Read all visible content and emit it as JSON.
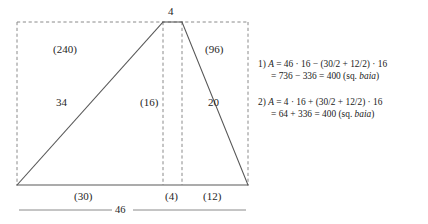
{
  "figure": {
    "colors": {
      "solid_line": "#585858",
      "dashed_line": "#8a8a8a",
      "text": "#262626"
    },
    "labels": {
      "apex_top": "4",
      "area_left": "(240)",
      "area_right": "(96)",
      "side_left": "34",
      "side_right": "20",
      "height_mid": "(16)",
      "base_left": "(30)",
      "base_mid": "(4)",
      "base_right": "(12)",
      "base_total": "46"
    },
    "geometry": {
      "rect_left": 17,
      "rect_right": 248,
      "rect_top": 22,
      "rect_bottom": 185,
      "apex_left_x": 163,
      "apex_right_x": 182,
      "baseline_y": 204
    }
  },
  "equations": [
    {
      "index": "1)",
      "line1": "A = 46 · 16 − (30/2 + 12/2) · 16",
      "line1_var": "A",
      "line1_rest": " = 46 · 16 − (30/2 + 12/2) · 16",
      "line2_main": "= 736 − 336 = 400 (sq. ",
      "line2_unit": "baia",
      "line2_tail": ")"
    },
    {
      "index": "2)",
      "line1": "A = 4 · 16 + (30/2 + 12/2) · 16",
      "line1_var": "A",
      "line1_rest": " = 4 · 16 + (30/2 + 12/2) · 16",
      "line2_main": "= 64 + 336 = 400 (sq. ",
      "line2_unit": "baia",
      "line2_tail": ")"
    }
  ]
}
